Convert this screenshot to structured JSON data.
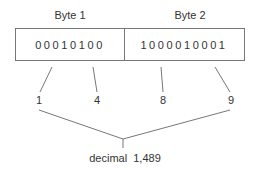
{
  "diagram": {
    "bytes": [
      {
        "label": "Byte 1",
        "bits": "00010100"
      },
      {
        "label": "Byte 2",
        "bits": "1000010001"
      }
    ],
    "digits": [
      "1",
      "4",
      "8",
      "9"
    ],
    "result": "decimal  1,489"
  },
  "colors": {
    "line": "#777777",
    "text": "#333333"
  }
}
